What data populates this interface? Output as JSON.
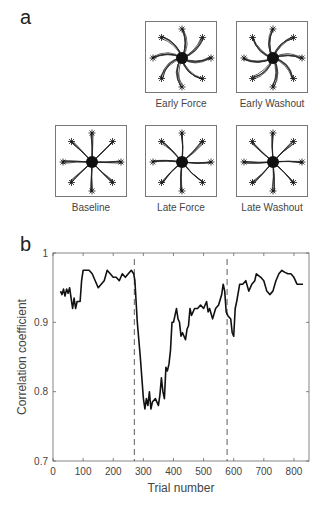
{
  "figure": {
    "panel_a_letter": "a",
    "panel_b_letter": "b",
    "trajectory_panels": [
      {
        "id": "early-force",
        "label": "Early Force",
        "row": 0,
        "col": 1,
        "twist": 0.9
      },
      {
        "id": "early-washout",
        "label": "Early Washout",
        "row": 0,
        "col": 2,
        "twist": -0.8
      },
      {
        "id": "baseline",
        "label": "Baseline",
        "row": 1,
        "col": 0,
        "twist": 0.08
      },
      {
        "id": "late-force",
        "label": "Late Force",
        "row": 1,
        "col": 1,
        "twist": 0.2
      },
      {
        "id": "late-washout",
        "label": "Late Washout",
        "row": 1,
        "col": 2,
        "twist": -0.15
      }
    ]
  },
  "chart_data": {
    "type": "line",
    "title": "",
    "xlabel": "Trial number",
    "ylabel": "Correlation coefficient",
    "xlim": [
      0,
      850
    ],
    "ylim": [
      0.7,
      1.0
    ],
    "xticks": [
      0,
      100,
      200,
      300,
      400,
      500,
      600,
      700,
      800
    ],
    "yticks": [
      0.7,
      0.8,
      0.9,
      1.0
    ],
    "ytick_labels": [
      "0.7",
      "0.8",
      "0.9",
      "1"
    ],
    "grid": false,
    "legend": null,
    "annotations": [
      {
        "type": "vline",
        "x": 270,
        "style": "dashed",
        "meaning": "force field on"
      },
      {
        "type": "vline",
        "x": 578,
        "style": "dashed",
        "meaning": "force field off (washout)"
      }
    ],
    "series": [
      {
        "name": "Correlation coefficient",
        "x": [
          25,
          30,
          35,
          40,
          45,
          50,
          55,
          60,
          65,
          70,
          75,
          80,
          90,
          95,
          100,
          110,
          120,
          130,
          140,
          150,
          160,
          170,
          180,
          190,
          200,
          210,
          220,
          230,
          240,
          250,
          260,
          268,
          272,
          280,
          290,
          300,
          305,
          310,
          315,
          320,
          325,
          330,
          340,
          350,
          355,
          360,
          365,
          370,
          375,
          380,
          385,
          390,
          395,
          400,
          405,
          410,
          415,
          420,
          425,
          430,
          440,
          445,
          450,
          455,
          460,
          470,
          480,
          490,
          500,
          510,
          515,
          520,
          530,
          540,
          550,
          560,
          565,
          570,
          575,
          580,
          590,
          595,
          600,
          605,
          610,
          620,
          630,
          640,
          650,
          660,
          670,
          675,
          690,
          700,
          710,
          720,
          730,
          740,
          750,
          760,
          770,
          780,
          790,
          800,
          810,
          820,
          830
        ],
        "values": [
          0.945,
          0.94,
          0.948,
          0.938,
          0.948,
          0.942,
          0.95,
          0.935,
          0.92,
          0.935,
          0.92,
          0.93,
          0.93,
          0.96,
          0.975,
          0.975,
          0.975,
          0.97,
          0.96,
          0.95,
          0.955,
          0.96,
          0.975,
          0.97,
          0.965,
          0.965,
          0.96,
          0.97,
          0.965,
          0.97,
          0.975,
          0.97,
          0.96,
          0.9,
          0.85,
          0.79,
          0.775,
          0.79,
          0.78,
          0.8,
          0.775,
          0.785,
          0.79,
          0.78,
          0.795,
          0.82,
          0.8,
          0.79,
          0.835,
          0.83,
          0.84,
          0.86,
          0.9,
          0.9,
          0.91,
          0.92,
          0.905,
          0.9,
          0.88,
          0.885,
          0.875,
          0.89,
          0.895,
          0.92,
          0.91,
          0.92,
          0.92,
          0.925,
          0.92,
          0.93,
          0.915,
          0.92,
          0.905,
          0.92,
          0.925,
          0.94,
          0.955,
          0.945,
          0.915,
          0.91,
          0.905,
          0.885,
          0.88,
          0.92,
          0.93,
          0.955,
          0.955,
          0.96,
          0.945,
          0.955,
          0.96,
          0.97,
          0.965,
          0.96,
          0.945,
          0.94,
          0.945,
          0.96,
          0.97,
          0.975,
          0.972,
          0.97,
          0.97,
          0.965,
          0.955,
          0.955,
          0.955
        ]
      }
    ]
  }
}
